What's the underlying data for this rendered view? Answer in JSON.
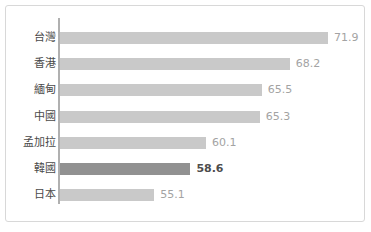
{
  "chart_data": {
    "type": "bar",
    "orientation": "horizontal",
    "title": "",
    "subtitle": "",
    "xlabel": "",
    "ylabel": "",
    "grid": false,
    "legend": null,
    "xlim": [
      46,
      76
    ],
    "categories": [
      "台灣",
      "香港",
      "緬甸",
      "中國",
      "孟加拉",
      "韓國",
      "日本"
    ],
    "values": [
      71.9,
      68.2,
      65.5,
      65.3,
      60.1,
      58.6,
      55.1
    ],
    "value_labels": [
      "71.9",
      "68.2",
      "65.5",
      "65.3",
      "60.1",
      "58.6",
      "55.1"
    ],
    "highlight_index": 5,
    "highlight_category": "韓國",
    "colors": {
      "bar": "#c9c9c9",
      "bar_highlight": "#919191",
      "value_text": "#a3a3a3",
      "value_text_highlight": "#4d4d4d",
      "category_text": "#4a4a4a",
      "axis_line": "#b0b0b0",
      "border": "#d8d8d8",
      "background": "#ffffff"
    }
  }
}
